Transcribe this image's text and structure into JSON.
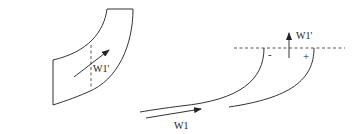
{
  "diagram": {
    "left_figure": {
      "description": "curved channel passage",
      "velocity_label": "W1'"
    },
    "right_figure": {
      "description": "blade profiles with outlet reference line",
      "outlet_velocity_label": "W1'",
      "inlet_velocity_label": "W1",
      "pressure_side_sign": "+",
      "suction_side_sign": "-"
    },
    "colors": {
      "line": "#333333",
      "background": "#ffffff"
    }
  }
}
